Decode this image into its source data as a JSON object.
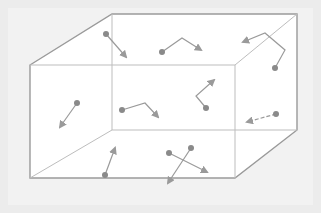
{
  "diagram": {
    "title": "",
    "colors": {
      "background": "#ececec",
      "box_fill": "#ffffff",
      "outline": "#9a9a9a",
      "inner_edge": "#bdbdbd",
      "particle": "#8a8a8a",
      "arrow": "#9a9a9a"
    },
    "box": {
      "front_face": [
        [
          30,
          65
        ],
        [
          235,
          65
        ],
        [
          235,
          178
        ],
        [
          30,
          178
        ]
      ],
      "back_face": [
        [
          112,
          14
        ],
        [
          297,
          14
        ],
        [
          297,
          130
        ],
        [
          112,
          130
        ]
      ]
    },
    "particles": [
      {
        "id": "p1",
        "dot": [
          106,
          34
        ],
        "path": [
          [
            106,
            34
          ],
          [
            126,
            57
          ]
        ],
        "dashed": false
      },
      {
        "id": "p2",
        "dot": [
          162,
          52
        ],
        "path": [
          [
            162,
            52
          ],
          [
            182,
            38
          ],
          [
            201,
            50
          ]
        ],
        "dashed": false
      },
      {
        "id": "p3",
        "dot": [
          275,
          68
        ],
        "path": [
          [
            275,
            68
          ],
          [
            285,
            50
          ],
          [
            265,
            33
          ],
          [
            243,
            42
          ]
        ],
        "dashed": false
      },
      {
        "id": "p4",
        "dot": [
          77,
          103
        ],
        "path": [
          [
            77,
            103
          ],
          [
            60,
            127
          ]
        ],
        "dashed": false
      },
      {
        "id": "p5",
        "dot": [
          122,
          110
        ],
        "path": [
          [
            122,
            110
          ],
          [
            145,
            103
          ],
          [
            158,
            117
          ]
        ],
        "dashed": false
      },
      {
        "id": "p6",
        "dot": [
          206,
          108
        ],
        "path": [
          [
            206,
            108
          ],
          [
            196,
            96
          ],
          [
            214,
            80
          ]
        ],
        "dashed": false
      },
      {
        "id": "p7",
        "dot": [
          276,
          114
        ],
        "path": [
          [
            276,
            114
          ],
          [
            247,
            122
          ]
        ],
        "dashed": true
      },
      {
        "id": "p8",
        "dot": [
          105,
          175
        ],
        "path": [
          [
            105,
            175
          ],
          [
            115,
            148
          ]
        ],
        "dashed": false
      },
      {
        "id": "p9",
        "dot": [
          169,
          153
        ],
        "path": [
          [
            169,
            153
          ],
          [
            207,
            172
          ]
        ],
        "dashed": false
      },
      {
        "id": "p10",
        "dot": [
          191,
          148
        ],
        "path": [
          [
            191,
            148
          ],
          [
            168,
            183
          ]
        ],
        "dashed": false
      }
    ]
  }
}
